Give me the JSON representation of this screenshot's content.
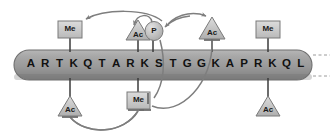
{
  "figure": {
    "tail_label": "H3 N-terminal tail",
    "colors": {
      "tail_fill": "#9b9b9b",
      "tail_edge": "#6f6f6f",
      "mark_square_fill": "#c9c9c9",
      "mark_triangle_fill": "#bdbdbd",
      "mark_circle_fill": "#c4c4c4",
      "mark_stroke": "#6a6a6a",
      "arrow_color": "#7b7b7b",
      "text_color": "#111111"
    }
  },
  "sequence": {
    "string": "ARTKQTARKSTGGKAPRKQL",
    "residues": [
      {
        "i": 1,
        "letter": "A"
      },
      {
        "i": 2,
        "letter": "R"
      },
      {
        "i": 3,
        "letter": "T"
      },
      {
        "i": 4,
        "letter": "K"
      },
      {
        "i": 5,
        "letter": "Q"
      },
      {
        "i": 6,
        "letter": "T"
      },
      {
        "i": 7,
        "letter": "A"
      },
      {
        "i": 8,
        "letter": "R"
      },
      {
        "i": 9,
        "letter": "K"
      },
      {
        "i": 10,
        "letter": "S"
      },
      {
        "i": 11,
        "letter": "T"
      },
      {
        "i": 12,
        "letter": "G"
      },
      {
        "i": 13,
        "letter": "G"
      },
      {
        "i": 14,
        "letter": "K"
      },
      {
        "i": 15,
        "letter": "A"
      },
      {
        "i": 16,
        "letter": "P"
      },
      {
        "i": 17,
        "letter": "R"
      },
      {
        "i": 18,
        "letter": "K"
      },
      {
        "i": 19,
        "letter": "Q"
      },
      {
        "i": 20,
        "letter": "L"
      }
    ]
  },
  "marks": [
    {
      "id": "me-k4-top",
      "label": "Me",
      "shape": "square",
      "side": "top",
      "residue": 4
    },
    {
      "id": "ac-k9-top",
      "label": "Ac",
      "shape": "triangle",
      "side": "top",
      "residue": 9
    },
    {
      "id": "p-s10-top",
      "label": "P",
      "shape": "circle",
      "side": "top",
      "residue": 10
    },
    {
      "id": "ac-k14-top",
      "label": "Ac",
      "shape": "triangle",
      "side": "top",
      "residue": 14
    },
    {
      "id": "me-k18-top",
      "label": "Me",
      "shape": "square",
      "side": "top",
      "residue": 18
    },
    {
      "id": "ac-k4-bot",
      "label": "Ac",
      "shape": "triangle",
      "side": "bottom",
      "residue": 4
    },
    {
      "id": "me-k9-bot",
      "label": "Me",
      "shape": "square",
      "side": "bottom",
      "residue": 9
    },
    {
      "id": "ac-k18-bot",
      "label": "Ac",
      "shape": "triangle",
      "side": "bottom",
      "residue": 18
    }
  ],
  "crosstalk": [
    {
      "id": "x1",
      "from": "p-s10-top",
      "to": "me-k4-top",
      "type": "activation"
    },
    {
      "id": "x2",
      "from": "p-s10-top",
      "to": "ac-k9-top",
      "type": "activation"
    },
    {
      "id": "x3",
      "from": "ac-k14-top",
      "to": "p-s10-top",
      "type": "activation"
    },
    {
      "id": "x4",
      "from": "p-s10-top",
      "to": "ac-k14-top",
      "type": "activation"
    },
    {
      "id": "x5",
      "from": "p-s10-top",
      "to": "me-k9-bot",
      "type": "inhibition"
    },
    {
      "id": "x6",
      "from": "ac-k14-top",
      "to": "me-k9-bot",
      "type": "inhibition"
    },
    {
      "id": "x7",
      "from": "ac-k4-bot",
      "to": "me-k9-bot",
      "type": "inhibition"
    },
    {
      "id": "x8",
      "from": "me-k9-bot",
      "to": "ac-k4-bot",
      "type": "inhibition"
    }
  ]
}
